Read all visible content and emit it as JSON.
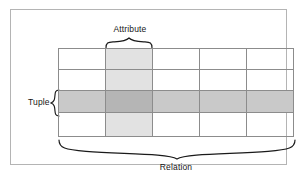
{
  "diagram": {
    "labels": {
      "attribute": "Attribute",
      "tuple": "Tuple",
      "relation": "Relation"
    },
    "colors": {
      "frame_border": "#b4b4b4",
      "grid_line": "#8c8c8c",
      "attribute_shade": "#e2e2e2",
      "tuple_shade": "#c9c9c9",
      "intersection_shade": "#b5b5b5",
      "background": "#ffffff",
      "text": "#161616"
    },
    "grid": {
      "columns": 5,
      "rows": 4,
      "highlighted_column_index": 1,
      "highlighted_row_index": 2
    },
    "braces": {
      "attribute_orientation": "down",
      "tuple_orientation": "left",
      "relation_orientation": "up"
    }
  }
}
